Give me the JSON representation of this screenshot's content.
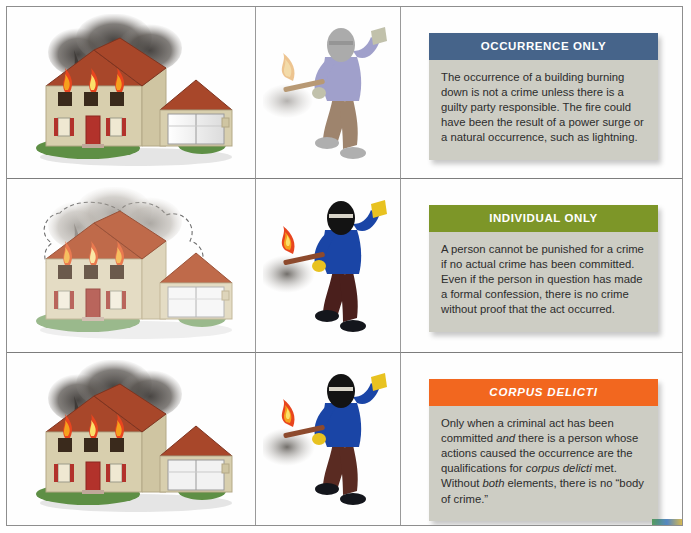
{
  "figure": {
    "columns": [
      "burning-building-illustration",
      "arsonist-illustration",
      "explanation-callout"
    ],
    "frame_color": "#8e8e8e"
  },
  "rows": [
    {
      "id": "occurrence-only",
      "house": {
        "alt": "Two-story house with attached garage engulfed in flames with black smoke",
        "style": "solid",
        "roof_color": "#a8472a",
        "siding_color": "#d8cfae",
        "door_color": "#b2322b",
        "garage_color": "#f2f2f2",
        "smoke_color": "#3e3a37",
        "grass_color": "#5e8f45",
        "flame_colors": [
          "#f6a11d",
          "#e8451f",
          "#fbe06a"
        ]
      },
      "person": {
        "alt": "Ghosted figure in ski mask holding a lit torch",
        "style": "faded",
        "shirt_color": "#8c8cc0",
        "pants_color": "#8a6a4e",
        "mask_color": "#9a9a9a",
        "glove_color": "#b4b49a",
        "shoe_color": "#9e9e9e",
        "torch_color": "#a98456"
      },
      "callout": {
        "header": "OCCURRENCE ONLY",
        "header_color": "#46648a",
        "header_italic": false,
        "body": "The occurrence of a building burning down is not a crime unless there is a guilty party responsible. The fire could have been the result of a power surge or a natural occurrence, such as lightning.",
        "body_color": "#cdcdc4"
      }
    },
    {
      "id": "individual-only",
      "house": {
        "alt": "Faded outlined house with flames, drawn as a hypothetical",
        "style": "faded",
        "roof_color": "#bf6a4a",
        "siding_color": "#e4dcc4",
        "door_color": "#b9655c",
        "garage_color": "#f7f7f7",
        "smoke_color": "#8d8881",
        "grass_color": "#9ab98c",
        "flame_colors": [
          "#f6bf60",
          "#ea7a50",
          "#fbe8a6"
        ]
      },
      "person": {
        "alt": "Figure in black ski mask and blue sweatshirt holding a lit torch",
        "style": "solid",
        "shirt_color": "#1a45a6",
        "pants_color": "#4a1f1c",
        "mask_color": "#131313",
        "glove_color": "#e8c220",
        "shoe_color": "#14161c",
        "torch_color": "#8d4a2d"
      },
      "callout": {
        "header": "INDIVIDUAL ONLY",
        "header_color": "#7d9628",
        "header_italic": false,
        "body": "A person cannot be punished for a crime if no actual crime has been committed. Even if the person in question has made a formal confession, there is no crime without proof that the act occurred.",
        "body_color": "#cdcdc4"
      }
    },
    {
      "id": "corpus-delicti",
      "house": {
        "alt": "Two-story house with attached garage engulfed in flames with black smoke",
        "style": "solid",
        "roof_color": "#a8472a",
        "siding_color": "#d8cfae",
        "door_color": "#b2322b",
        "garage_color": "#f2f2f2",
        "smoke_color": "#3e3a37",
        "grass_color": "#5e8f45",
        "flame_colors": [
          "#f6a11d",
          "#e8451f",
          "#fbe06a"
        ]
      },
      "person": {
        "alt": "Figure in black ski mask and blue sweatshirt holding a lit torch",
        "style": "solid",
        "shirt_color": "#1a45a6",
        "pants_color": "#5a2b22",
        "mask_color": "#131313",
        "glove_color": "#e8c220",
        "shoe_color": "#14161c",
        "torch_color": "#8d4a2d"
      },
      "callout": {
        "header": "CORPUS DELICTI",
        "header_color": "#f2671f",
        "header_italic": true,
        "body_runs": [
          {
            "t": "Only when a criminal act has been committed ",
            "i": false
          },
          {
            "t": "and",
            "i": true
          },
          {
            "t": " there is a person whose actions caused the occurrence are the qualifications for ",
            "i": false
          },
          {
            "t": "corpus delicti",
            "i": true
          },
          {
            "t": " met. Without ",
            "i": false
          },
          {
            "t": "both",
            "i": true
          },
          {
            "t": " elements, there is no “body of crime.”",
            "i": false
          }
        ],
        "body_color": "#cdcdc4"
      }
    }
  ]
}
